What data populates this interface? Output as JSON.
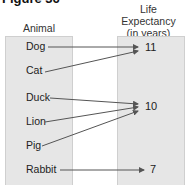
{
  "figure": {
    "title": "Figure 36"
  },
  "headers": {
    "left": "Animal",
    "right_line1": "Life Expectancy",
    "right_line2": "(in years)"
  },
  "animals": [
    "Dog",
    "Cat",
    "Duck",
    "Lion",
    "Pig",
    "Rabbit"
  ],
  "values": [
    "11",
    "10",
    "7"
  ],
  "mapping": [
    {
      "animal": "Dog",
      "years": "11"
    },
    {
      "animal": "Cat",
      "years": "11"
    },
    {
      "animal": "Duck",
      "years": "10"
    },
    {
      "animal": "Lion",
      "years": "10"
    },
    {
      "animal": "Pig",
      "years": "10"
    },
    {
      "animal": "Rabbit",
      "years": "7"
    }
  ],
  "colors": {
    "box": "#e6e6e6",
    "arrow": "#555555"
  }
}
